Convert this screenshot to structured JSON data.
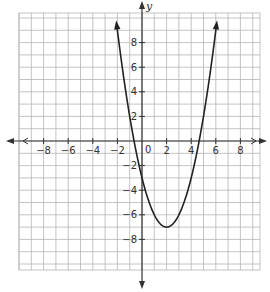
{
  "chart_data": {
    "type": "line",
    "title": "",
    "xlabel": "",
    "ylabel": "y",
    "function": "y = (x - 2)^2 - 7",
    "vertex": [
      2,
      -7
    ],
    "x_intercepts": [
      -0.65,
      4.65
    ],
    "y_intercept": -3,
    "xlim": [
      -10,
      10
    ],
    "ylim": [
      -10,
      10
    ],
    "grid": true,
    "x_ticks": [
      -8,
      -6,
      -4,
      -2,
      2,
      4,
      6,
      8
    ],
    "x_tick_labels": [
      "−8",
      "−6",
      "−4",
      "−2",
      "2",
      "4",
      "6",
      "8"
    ],
    "y_ticks": [
      8,
      6,
      4,
      2,
      -2,
      -4,
      -6,
      -8
    ],
    "y_tick_labels": [
      "8",
      "6",
      "4",
      "2",
      "−2",
      "−4",
      "−6",
      "−8"
    ],
    "origin_label": "0",
    "series": [
      {
        "name": "parabola",
        "x": [
          -2.06,
          -1,
          0,
          1,
          2,
          3,
          4,
          5,
          6.06
        ],
        "values": [
          9.5,
          2,
          -3,
          -6,
          -7,
          -6,
          -3,
          2,
          9.5
        ]
      }
    ],
    "colors": {
      "grid": "#b5b5b5",
      "axis": "#333333",
      "curve": "#222222"
    }
  }
}
